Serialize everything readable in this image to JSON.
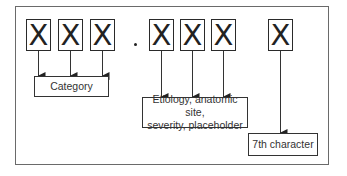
{
  "diagram": {
    "characters": [
      {
        "id": 1,
        "glyph": "X"
      },
      {
        "id": 2,
        "glyph": "X"
      },
      {
        "id": 3,
        "glyph": "X"
      },
      {
        "id": 4,
        "glyph": "X"
      },
      {
        "id": 5,
        "glyph": "X"
      },
      {
        "id": 6,
        "glyph": "X"
      },
      {
        "id": 7,
        "glyph": "X"
      }
    ],
    "separator": ".",
    "groups": [
      {
        "label": "Category",
        "characters": [
          1,
          2,
          3
        ]
      },
      {
        "label_line1": "Etiology, anatomic site,",
        "label_line2": "severity, placeholder",
        "characters": [
          4,
          5,
          6
        ]
      },
      {
        "label": "7th character",
        "characters": [
          7
        ]
      }
    ],
    "colors": {
      "stroke": "#2a2a2a",
      "frame": "#6a6a6a",
      "text": "#333333"
    }
  }
}
